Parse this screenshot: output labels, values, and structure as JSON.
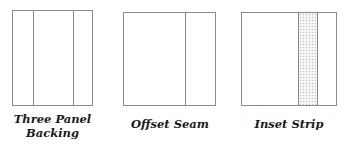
{
  "diagrams": [
    {
      "label_line1": "Three Panel",
      "label_line2": "Backing",
      "seams": 2
    },
    {
      "label_line1": "Offset Seam",
      "seams": 1
    },
    {
      "label_line1": "Inset Strip",
      "strip": "stippled"
    }
  ],
  "colors": {
    "line": "#8a8a8a",
    "text": "#1a1a1a",
    "strip_fill": "#f4f4f4"
  }
}
